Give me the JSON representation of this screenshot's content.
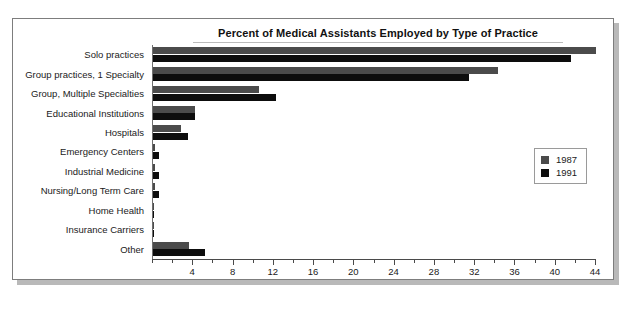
{
  "chart_data": {
    "type": "bar",
    "orientation": "horizontal",
    "title": "Percent of Medical Assistants Employed by Type of Practice",
    "xlabel": "",
    "ylabel": "",
    "xlim": [
      0,
      44
    ],
    "xticks": [
      0,
      2,
      4,
      6,
      8,
      10,
      12,
      14,
      16,
      18,
      20,
      22,
      24,
      26,
      28,
      30,
      32,
      34,
      36,
      38,
      40,
      42,
      44
    ],
    "xtick_labels": [
      "",
      "",
      "4",
      "",
      "8",
      "",
      "12",
      "",
      "16",
      "",
      "20",
      "",
      "24",
      "",
      "28",
      "",
      "32",
      "",
      "36",
      "",
      "40",
      "",
      "44"
    ],
    "grid": false,
    "legend_position": "right",
    "categories": [
      "Solo practices",
      "Group practices, 1 Specialty",
      "Group, Multiple Specialties",
      "Educational Institutions",
      "Hospitals",
      "Emergency Centers",
      "Industrial Medicine",
      "Nursing/Long Term Care",
      "Home Health",
      "Insurance Carriers",
      "Other"
    ],
    "series": [
      {
        "name": "1987",
        "color": "#4b4b4b",
        "values": [
          44.0,
          34.3,
          10.5,
          4.2,
          2.8,
          0.2,
          0.2,
          0.2,
          0.1,
          0.1,
          3.6
        ]
      },
      {
        "name": "1991",
        "color": "#0d0d0d",
        "values": [
          41.5,
          31.4,
          12.2,
          4.2,
          3.5,
          0.6,
          0.6,
          0.6,
          0.1,
          0.1,
          5.2
        ]
      }
    ]
  },
  "legend": {
    "entries": [
      {
        "label": "1987",
        "color": "#4b4b4b"
      },
      {
        "label": "1991",
        "color": "#0d0d0d"
      }
    ]
  }
}
